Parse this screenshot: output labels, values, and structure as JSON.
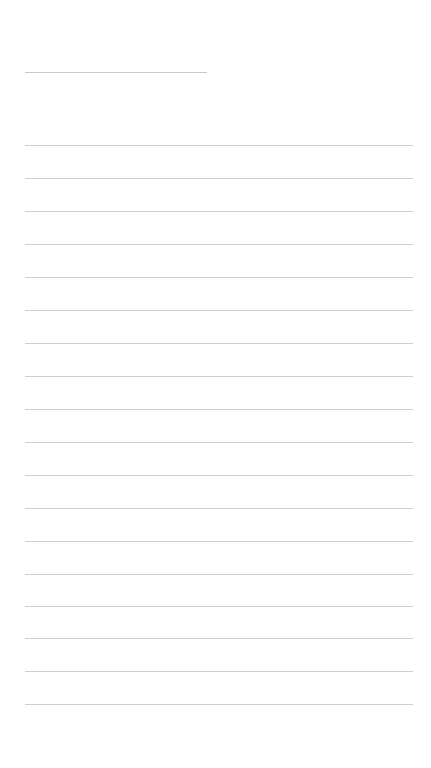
{
  "page": {
    "background": "#ffffff",
    "line_color": "#cfcfcf"
  },
  "title_line": {
    "text": ""
  },
  "lines": [
    {
      "text": ""
    },
    {
      "text": ""
    },
    {
      "text": ""
    },
    {
      "text": ""
    },
    {
      "text": ""
    },
    {
      "text": ""
    },
    {
      "text": ""
    },
    {
      "text": ""
    },
    {
      "text": ""
    },
    {
      "text": ""
    },
    {
      "text": ""
    },
    {
      "text": ""
    },
    {
      "text": ""
    },
    {
      "text": ""
    },
    {
      "text": ""
    },
    {
      "text": ""
    },
    {
      "text": ""
    },
    {
      "text": ""
    }
  ]
}
